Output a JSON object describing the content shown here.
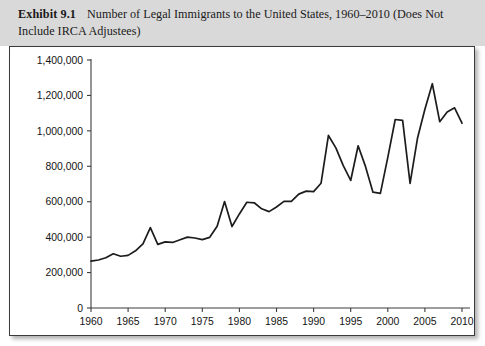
{
  "exhibit": {
    "label": "Exhibit 9.1",
    "caption": "Number of Legal Immigrants to the United States, 1960–2010 (Does Not Include IRCA Adjustees)"
  },
  "colors": {
    "caption_band": "#d9d9d9",
    "plot_background": "#ffffff",
    "frame_border": "#3b3b3b",
    "line": "#1c1c1c",
    "axis": "#3d3d3d",
    "text": "#1a1a1a"
  },
  "chart_data": {
    "type": "line",
    "title": "Number of Legal Immigrants to the United States, 1960–2010 (Does Not Include IRCA Adjustees)",
    "xlabel": "",
    "ylabel": "",
    "xlim": [
      1960,
      2010
    ],
    "ylim": [
      0,
      1400000
    ],
    "grid": false,
    "legend": "none",
    "ytick_labels": [
      "0",
      "200,000",
      "400,000",
      "600,000",
      "800,000",
      "1,000,000",
      "1,200,000",
      "1,400,000"
    ],
    "ytick_values": [
      0,
      200000,
      400000,
      600000,
      800000,
      1000000,
      1200000,
      1400000
    ],
    "xtick_labels": [
      "1960",
      "1965",
      "1970",
      "1975",
      "1980",
      "1985",
      "1990",
      "1995",
      "2000",
      "2005",
      "2010"
    ],
    "xtick_values": [
      1960,
      1965,
      1970,
      1975,
      1980,
      1985,
      1990,
      1995,
      2000,
      2005,
      2010
    ],
    "x": [
      1960,
      1961,
      1962,
      1963,
      1964,
      1965,
      1966,
      1967,
      1968,
      1969,
      1970,
      1971,
      1972,
      1973,
      1974,
      1975,
      1976,
      1977,
      1978,
      1979,
      1980,
      1981,
      1982,
      1983,
      1984,
      1985,
      1986,
      1987,
      1988,
      1989,
      1990,
      1991,
      1992,
      1993,
      1994,
      1995,
      1996,
      1997,
      1998,
      1999,
      2000,
      2001,
      2002,
      2003,
      2004,
      2005,
      2006,
      2007,
      2008,
      2009,
      2010
    ],
    "values": [
      265000,
      271000,
      284000,
      306000,
      292000,
      297000,
      323000,
      362000,
      454000,
      359000,
      373000,
      370000,
      385000,
      400000,
      395000,
      386000,
      399000,
      462000,
      601000,
      460000,
      531000,
      597000,
      594000,
      560000,
      544000,
      570000,
      602000,
      602000,
      643000,
      660000,
      657000,
      704000,
      974000,
      904000,
      804000,
      720000,
      916000,
      798000,
      654000,
      647000,
      850000,
      1064000,
      1059000,
      704000,
      958000,
      1122000,
      1266000,
      1052000,
      1107000,
      1130000,
      1043000
    ],
    "series": [
      {
        "name": "Legal immigrants admitted",
        "values": [
          265000,
          271000,
          284000,
          306000,
          292000,
          297000,
          323000,
          362000,
          454000,
          359000,
          373000,
          370000,
          385000,
          400000,
          395000,
          386000,
          399000,
          462000,
          601000,
          460000,
          531000,
          597000,
          594000,
          560000,
          544000,
          570000,
          602000,
          602000,
          643000,
          660000,
          657000,
          704000,
          974000,
          904000,
          804000,
          720000,
          916000,
          798000,
          654000,
          647000,
          850000,
          1064000,
          1059000,
          704000,
          958000,
          1122000,
          1266000,
          1052000,
          1107000,
          1130000,
          1043000
        ]
      }
    ]
  }
}
